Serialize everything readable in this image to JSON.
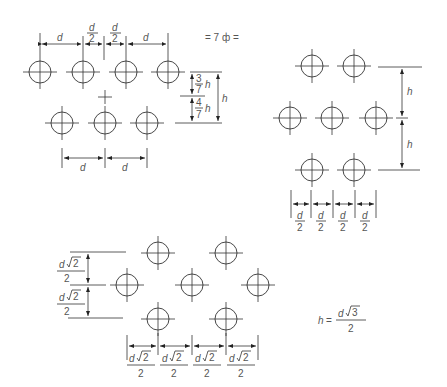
{
  "diagram": {
    "panels": [
      {
        "id": "square-offset",
        "note": "= 7 ф =",
        "top_dims": [
          "d",
          "d/2",
          "d/2",
          "d"
        ],
        "bottom_dims": [
          "d",
          "d"
        ],
        "side_dims": [
          "3/7 h",
          "4/7 h",
          "h"
        ]
      },
      {
        "id": "hex-rows",
        "side_dims": [
          "h",
          "h"
        ],
        "bottom_dims": [
          "d/2",
          "d/2",
          "d/2",
          "d/2"
        ]
      },
      {
        "id": "diamond",
        "side_dims": [
          "d√2/2",
          "d√2/2"
        ],
        "bottom_dims": [
          "d√2/2",
          "d√2/2",
          "d√2/2",
          "d√2/2"
        ]
      }
    ],
    "formula": {
      "lhs": "h =",
      "num_var": "d",
      "num_root": "3",
      "den": "2"
    },
    "labels": {
      "d": "d",
      "h": "h",
      "two": "2",
      "three": "3",
      "four": "4",
      "seven": "7",
      "sqrt2": "2",
      "note": "= 7 ф ="
    },
    "colors": {
      "line": "#333333",
      "text": "#555555",
      "background": "#ffffff"
    }
  }
}
